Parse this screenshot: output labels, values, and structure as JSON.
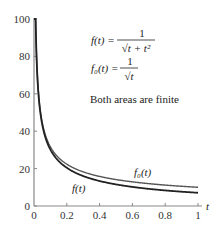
{
  "chart_data": {
    "type": "line",
    "title": "",
    "xlabel": "t",
    "ylabel": "",
    "xlim": [
      0,
      1
    ],
    "ylim": [
      0,
      100
    ],
    "grid": false,
    "x_ticks": [
      "0",
      "0.2",
      "0.4",
      "0.6",
      "0.8",
      "1"
    ],
    "y_ticks": [
      "0",
      "20",
      "40",
      "60",
      "80",
      "100"
    ],
    "series": [
      {
        "name": "f(t)",
        "formula": "1/sqrt(t + t^2)",
        "x": [
          0.0001,
          0.01,
          0.02,
          0.05,
          0.1,
          0.2,
          0.3,
          0.4,
          0.5,
          0.6,
          0.7,
          0.8,
          0.9,
          1.0
        ],
        "values": [
          100,
          9.95,
          7.0,
          4.36,
          3.02,
          2.04,
          1.6,
          1.34,
          1.15,
          1.02,
          0.92,
          0.83,
          0.76,
          0.71
        ],
        "color": "#222222",
        "label": "f(t)"
      },
      {
        "name": "f0(t)",
        "formula": "1/sqrt(t)",
        "x": [
          0.0001,
          0.01,
          0.02,
          0.05,
          0.1,
          0.2,
          0.3,
          0.4,
          0.5,
          0.6,
          0.7,
          0.8,
          0.9,
          1.0
        ],
        "values": [
          100,
          10.0,
          7.07,
          4.47,
          3.16,
          2.24,
          1.83,
          1.58,
          1.41,
          1.29,
          1.2,
          1.12,
          1.05,
          1.0
        ],
        "color": "#444444",
        "label": "f₀(t)"
      }
    ],
    "annotations": {
      "f_label": "f(t) =",
      "f_num": "1",
      "f_den": "√t + t²",
      "f0_label": "f₀(t) =",
      "f0_num": "1",
      "f0_den": "√t",
      "note": "Both areas are finite",
      "curve_label_f": "f(t)",
      "curve_label_f0": "f₀(t)"
    },
    "legend_position": "top-right"
  }
}
